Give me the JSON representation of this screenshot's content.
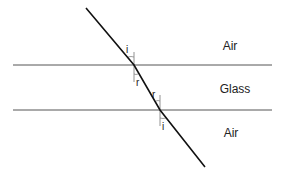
{
  "diagram": {
    "type": "refraction-through-glass-slab",
    "regions": [
      {
        "id": "top",
        "label": "Air"
      },
      {
        "id": "middle",
        "label": "Glass"
      },
      {
        "id": "bottom",
        "label": "Air"
      }
    ],
    "angle_labels": {
      "top_incident": "i",
      "top_refracted": "r",
      "bottom_incident": "r",
      "bottom_emergent": "i"
    },
    "colors": {
      "ray": "#111111",
      "boundary": "#555555",
      "normal": "#777777",
      "text": "#222222"
    }
  }
}
